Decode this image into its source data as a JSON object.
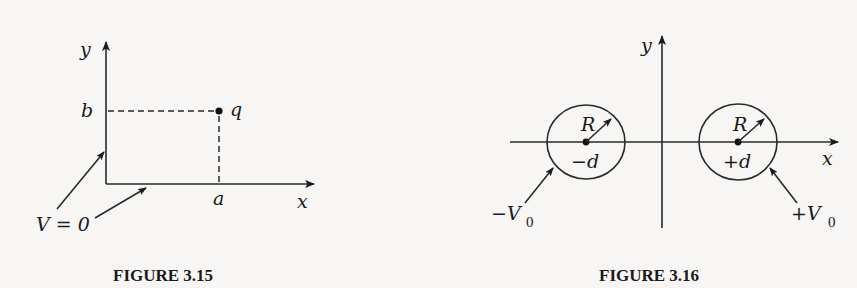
{
  "figures": [
    {
      "caption": "FIGURE 3.15",
      "labels": {
        "y_axis": "y",
        "x_axis": "x",
        "b": "b",
        "a": "a",
        "charge": "q",
        "boundary": "V = 0"
      },
      "description": "Grounded conducting planes along positive x and y axes with point charge q at (a, b)"
    },
    {
      "caption": "FIGURE 3.16",
      "labels": {
        "y_axis": "y",
        "x_axis": "x",
        "left_radius": "R",
        "right_radius": "R",
        "left_center": "−d",
        "right_center": "+d",
        "left_potential_main": "−V",
        "left_potential_sub": "0",
        "right_potential_main": "+V",
        "right_potential_sub": "0"
      },
      "description": "Two cylinders of radius R centered at x = −d and x = +d held at potentials −V0 and +V0"
    }
  ]
}
